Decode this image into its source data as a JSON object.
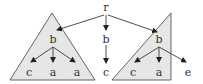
{
  "diagram": {
    "type": "tree",
    "colors": {
      "triangle_fill": "#e6e6e6",
      "triangle_stroke": "#555555",
      "edge": "#3a3a3a",
      "label": "#333333"
    },
    "root": {
      "label": "r"
    },
    "left_subtree": {
      "root": "b",
      "children": [
        "c",
        "a",
        "a"
      ]
    },
    "middle_path": {
      "nodes": [
        "b",
        "c"
      ]
    },
    "right_subtree": {
      "root": "b",
      "children": [
        "c",
        "a",
        "e"
      ]
    }
  }
}
